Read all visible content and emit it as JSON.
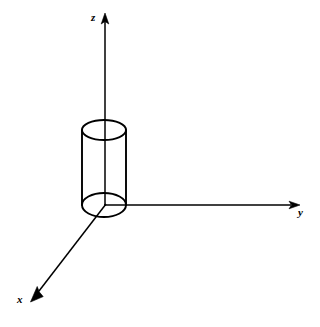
{
  "figure": {
    "background_color": "#ffffff",
    "line_color": "#000000",
    "width": 320,
    "height": 327
  },
  "axes": {
    "origin": {
      "x": 105,
      "y": 205
    },
    "z": {
      "label": "z",
      "direction": "up",
      "start": {
        "x": 105,
        "y": 205
      },
      "tip": {
        "x": 105,
        "y": 14
      },
      "label_position": {
        "x": 91,
        "y": 12
      }
    },
    "y": {
      "label": "y",
      "direction": "right",
      "start": {
        "x": 105,
        "y": 205
      },
      "tip": {
        "x": 299,
        "y": 205
      },
      "label_position": {
        "x": 298,
        "y": 207
      }
    },
    "x": {
      "label": "x",
      "direction": "down-left",
      "start": {
        "x": 105,
        "y": 205
      },
      "tip": {
        "x": 31,
        "y": 301
      },
      "label_position": {
        "x": 17,
        "y": 294
      }
    }
  },
  "cylinder": {
    "shape_name": "cylinder",
    "axis": "z",
    "center_x": 104,
    "left_x": 82,
    "right_x": 126,
    "radius_x": 22,
    "top_ellipse": {
      "cx": 104,
      "cy": 130,
      "rx": 22,
      "ry": 10
    },
    "bottom_ellipse": {
      "cx": 104,
      "cy": 205,
      "rx": 22,
      "ry": 12
    },
    "height": 75,
    "rendering": "wireframe"
  }
}
